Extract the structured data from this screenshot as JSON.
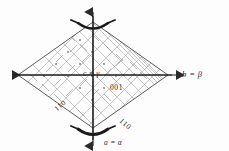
{
  "figure": {
    "kind": "crystallographic-projection-diagram",
    "shape": "rhombus",
    "background_color": "#fdfdfd",
    "line_color": "#2b2b2b",
    "grid_color": "#9a9a9a"
  },
  "axes": {
    "right_label": "b = β",
    "bottom_label": "a = α",
    "center_label": "c = γ",
    "horizontal_axis_name": "horizontal-axis",
    "vertical_axis_name": "vertical-axis"
  },
  "indices": {
    "face_center": "001",
    "edge_left": "110",
    "edge_right": "110"
  },
  "symmetry": {
    "top_symbol": "two-fold-rotation-axis",
    "bottom_symbol": "two-fold-rotation-axis"
  }
}
